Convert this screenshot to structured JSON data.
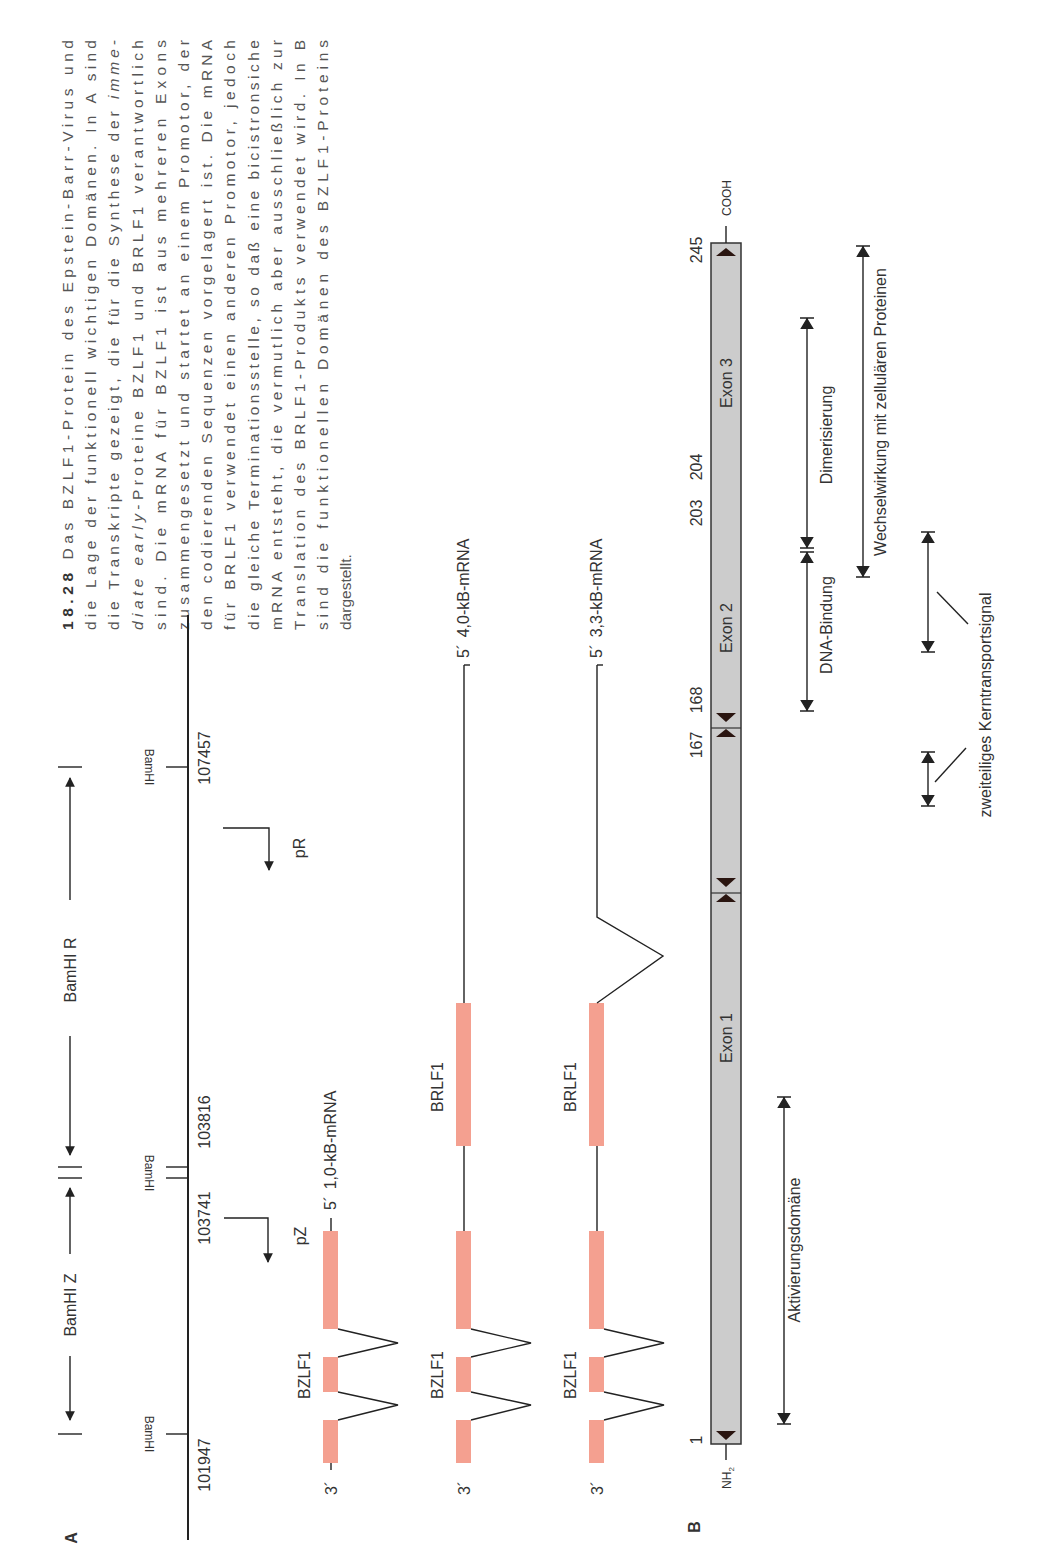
{
  "caption": {
    "figure_number": "18.28",
    "lines": [
      {
        "parts": [
          {
            "text": "18.28",
            "style": "bold"
          },
          {
            "text": "  Das BZLF1-Protein des Epstein-Barr-Virus und",
            "style": "normal"
          }
        ]
      },
      {
        "parts": [
          {
            "text": "die Lage der funktionell wichtigen Domänen. In A sind",
            "style": "normal"
          }
        ]
      },
      {
        "parts": [
          {
            "text": "die Transkripte gezeigt, die für die Synthese der ",
            "style": "normal"
          },
          {
            "text": "imme-",
            "style": "italic"
          }
        ]
      },
      {
        "parts": [
          {
            "text": "diate early",
            "style": "italic"
          },
          {
            "text": "-Proteine BZLF1 und BRLF1 verantwortlich",
            "style": "normal"
          }
        ]
      },
      {
        "parts": [
          {
            "text": "sind. Die mRNA für BZLF1 ist aus mehreren Exons",
            "style": "normal"
          }
        ]
      },
      {
        "parts": [
          {
            "text": "zusammengesetzt und startet an einem Promotor, der",
            "style": "normal"
          }
        ]
      },
      {
        "parts": [
          {
            "text": "den codierenden Sequenzen vorgelagert ist. Die mRNA",
            "style": "normal"
          }
        ]
      },
      {
        "parts": [
          {
            "text": "für BRLF1 verwendet einen anderen Promotor, jedoch",
            "style": "normal"
          }
        ]
      },
      {
        "parts": [
          {
            "text": "die gleiche Terminationsstelle, so daß eine bicistronsiche",
            "style": "normal"
          }
        ]
      },
      {
        "parts": [
          {
            "text": "mRNA entsteht, die vermutlich aber ausschließlich zur",
            "style": "normal"
          }
        ]
      },
      {
        "parts": [
          {
            "text": "Translation des BRLF1-Produkts verwendet wird. In B",
            "style": "normal"
          }
        ]
      },
      {
        "parts": [
          {
            "text": "sind die funktionellen Domänen des BZLF1-Proteins",
            "style": "normal"
          }
        ]
      },
      {
        "parts": [
          {
            "text": "dargestellt.",
            "style": "normal"
          }
        ]
      }
    ]
  },
  "panel_a": {
    "label": "A",
    "fragments": [
      {
        "name": "BamHI Z"
      },
      {
        "name": "BamHI R"
      }
    ],
    "sites": [
      {
        "label": "BamHI",
        "coordinate": "101947"
      },
      {
        "label": "BamHI",
        "coordinate": "103741"
      },
      {
        "label": "",
        "coordinate": "103816"
      },
      {
        "label": "BamHI",
        "coordinate": "107457"
      }
    ],
    "promoters": [
      "pZ",
      "pR"
    ],
    "transcripts": [
      {
        "name": "1,0-kB-mRNA",
        "five_prime": "5´",
        "three_prime": "3´",
        "genes": [
          "BZLF1"
        ]
      },
      {
        "name": "4,0-kB-mRNA",
        "five_prime": "5´",
        "three_prime": "3´",
        "genes": [
          "BZLF1",
          "BRLF1"
        ]
      },
      {
        "name": "3,3-kB-mRNA",
        "five_prime": "5´",
        "three_prime": "3´",
        "genes": [
          "BZLF1",
          "BRLF1"
        ]
      }
    ],
    "exon_color": "#f4a090"
  },
  "panel_b": {
    "label": "B",
    "n_terminus": "NH",
    "n_terminus_sub": "2",
    "c_terminus": "COOH",
    "positions": [
      "1",
      "167",
      "168",
      "203",
      "204",
      "245"
    ],
    "exons": [
      "Exon 1",
      "Exon 2",
      "Exon 3"
    ],
    "domains": [
      "Aktivierungsdomäne",
      "DNA-Bindung",
      "Dimerisierung",
      "Wechselwirkung mit zellulären Proteinen",
      "zweiteiliges Kerntransportsignal"
    ],
    "bar_color": "#cccccc"
  }
}
